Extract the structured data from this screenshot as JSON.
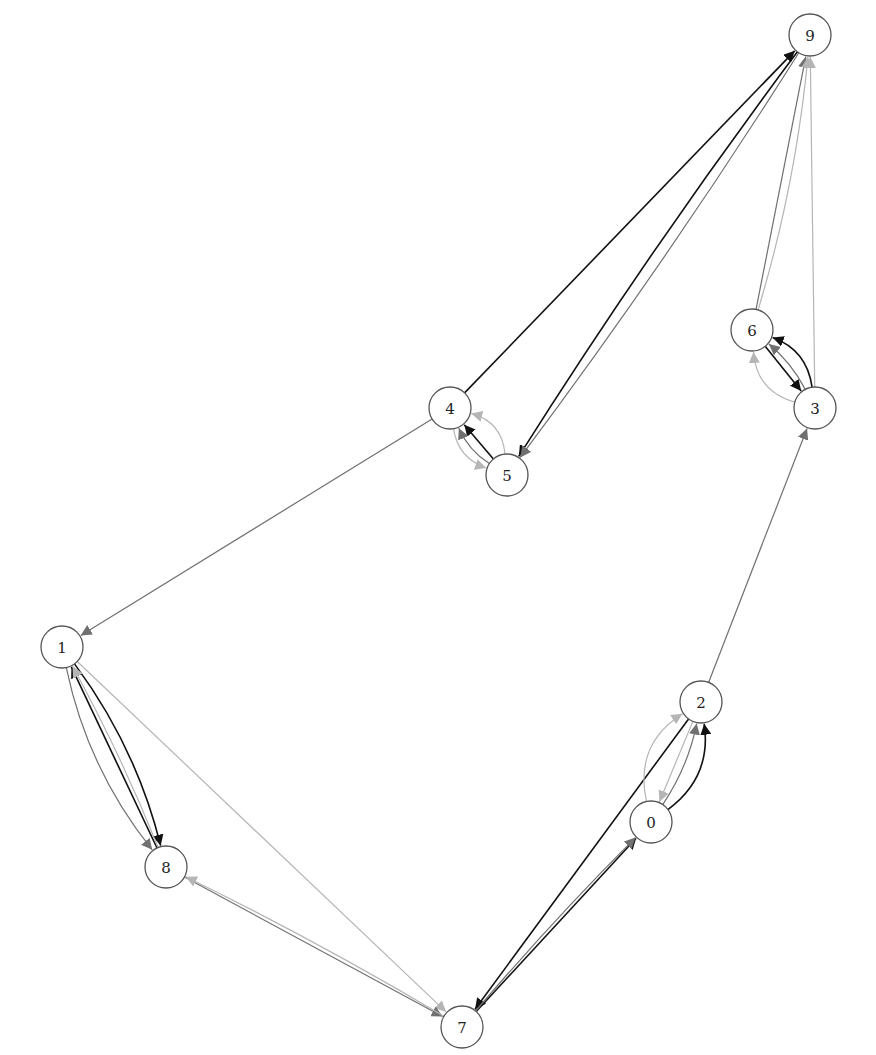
{
  "diagram": {
    "type": "directed-multigraph",
    "node_radius": 21,
    "colors": {
      "black": "#111111",
      "gray": "#707070",
      "lightgray": "#b5b5b5"
    },
    "nodes": [
      {
        "id": "0",
        "label": "0",
        "x": 651,
        "y": 822
      },
      {
        "id": "1",
        "label": "1",
        "x": 62,
        "y": 647
      },
      {
        "id": "2",
        "label": "2",
        "x": 701,
        "y": 702
      },
      {
        "id": "3",
        "label": "3",
        "x": 815,
        "y": 408
      },
      {
        "id": "4",
        "label": "4",
        "x": 450,
        "y": 408
      },
      {
        "id": "5",
        "label": "5",
        "x": 507,
        "y": 475
      },
      {
        "id": "6",
        "label": "6",
        "x": 752,
        "y": 330
      },
      {
        "id": "7",
        "label": "7",
        "x": 462,
        "y": 1027
      },
      {
        "id": "8",
        "label": "8",
        "x": 166,
        "y": 867
      },
      {
        "id": "9",
        "label": "9",
        "x": 810,
        "y": 35
      }
    ],
    "edges": [
      {
        "from": "4",
        "to": "9",
        "color": "black",
        "curve": 0
      },
      {
        "from": "9",
        "to": "5",
        "color": "black",
        "curve": 0.02
      },
      {
        "from": "9",
        "to": "5",
        "color": "gray",
        "curve": -0.02
      },
      {
        "from": "6",
        "to": "9",
        "color": "gray",
        "curve": 0
      },
      {
        "from": "6",
        "to": "9",
        "color": "lightgray",
        "curve": 0.05
      },
      {
        "from": "3",
        "to": "9",
        "color": "lightgray",
        "curve": 0
      },
      {
        "from": "6",
        "to": "3",
        "color": "black",
        "curve": 0
      },
      {
        "from": "3",
        "to": "6",
        "color": "black",
        "curve": 0.3
      },
      {
        "from": "3",
        "to": "6",
        "color": "gray",
        "curve": 0.1
      },
      {
        "from": "3",
        "to": "6",
        "color": "lightgray",
        "curve": -0.35
      },
      {
        "from": "5",
        "to": "4",
        "color": "black",
        "curve": 0
      },
      {
        "from": "5",
        "to": "4",
        "color": "gray",
        "curve": -0.15
      },
      {
        "from": "5",
        "to": "4",
        "color": "lightgray",
        "curve": 0.35
      },
      {
        "from": "4",
        "to": "5",
        "color": "lightgray",
        "curve": 0.3
      },
      {
        "from": "4",
        "to": "1",
        "color": "gray",
        "curve": 0
      },
      {
        "from": "1",
        "to": "8",
        "color": "black",
        "curve": -0.1
      },
      {
        "from": "8",
        "to": "1",
        "color": "black",
        "curve": 0
      },
      {
        "from": "8",
        "to": "1",
        "color": "lightgray",
        "curve": 0.03
      },
      {
        "from": "1",
        "to": "8",
        "color": "gray",
        "curve": 0.12
      },
      {
        "from": "1",
        "to": "7",
        "color": "lightgray",
        "curve": 0
      },
      {
        "from": "8",
        "to": "7",
        "color": "gray",
        "curve": 0
      },
      {
        "from": "7",
        "to": "8",
        "color": "lightgray",
        "curve": 0.02
      },
      {
        "from": "2",
        "to": "7",
        "color": "black",
        "curve": 0
      },
      {
        "from": "7",
        "to": "0",
        "color": "black",
        "curve": 0
      },
      {
        "from": "7",
        "to": "0",
        "color": "gray",
        "curve": -0.02
      },
      {
        "from": "0",
        "to": "2",
        "color": "black",
        "curve": 0.3
      },
      {
        "from": "0",
        "to": "2",
        "color": "gray",
        "curve": 0.1
      },
      {
        "from": "2",
        "to": "0",
        "color": "lightgray",
        "curve": 0
      },
      {
        "from": "0",
        "to": "2",
        "color": "lightgray",
        "curve": -0.35
      },
      {
        "from": "2",
        "to": "3",
        "color": "gray",
        "curve": 0
      }
    ]
  }
}
